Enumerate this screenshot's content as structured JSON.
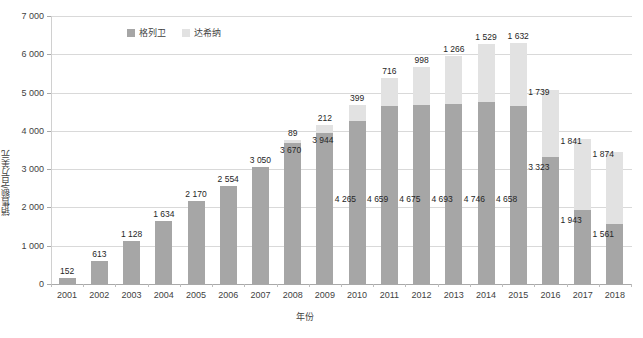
{
  "chart_data": {
    "type": "bar",
    "stacked": true,
    "title": "",
    "xlabel": "年份",
    "ylabel": "销售额/百万美元",
    "ylim": [
      0,
      7000
    ],
    "ytick_labels": [
      "7 000",
      "6 000",
      "5 000",
      "4 000",
      "3 000",
      "2 000",
      "1 000",
      "0"
    ],
    "ytick_values": [
      7000,
      6000,
      5000,
      4000,
      3000,
      2000,
      1000,
      0
    ],
    "grid": true,
    "legend_position": "top-left-inside",
    "categories": [
      "2001",
      "2002",
      "2003",
      "2004",
      "2005",
      "2006",
      "2007",
      "2008",
      "2009",
      "2010",
      "2011",
      "2012",
      "2013",
      "2014",
      "2015",
      "2016",
      "2017",
      "2018"
    ],
    "series": [
      {
        "name": "格列卫",
        "color": "#a6a6a6",
        "values": [
          152,
          613,
          1128,
          1634,
          2170,
          2554,
          3050,
          3670,
          3944,
          4265,
          4659,
          4675,
          4693,
          4746,
          4658,
          3323,
          1943,
          1561
        ],
        "labels": [
          "152",
          "613",
          "1 128",
          "1 634",
          "2 170",
          "2 554",
          "3 050",
          "3 670",
          "3 944",
          "4 265",
          "4 659",
          "4 675",
          "4 693",
          "4 746",
          "4 658",
          "3 323",
          "1 943",
          "1 561"
        ]
      },
      {
        "name": "达希纳",
        "color": "#e2e2e2",
        "values": [
          0,
          0,
          0,
          0,
          0,
          0,
          0,
          89,
          212,
          399,
          716,
          998,
          1266,
          1529,
          1632,
          1739,
          1841,
          1874
        ],
        "labels": [
          "",
          "",
          "",
          "",
          "",
          "",
          "",
          "89",
          "212",
          "399",
          "716",
          "998",
          "1 266",
          "1 529",
          "1 632",
          "1 739",
          "1 841",
          "1 874"
        ]
      }
    ]
  },
  "legend": {
    "items": [
      {
        "label": "格列卫",
        "color": "#a6a6a6"
      },
      {
        "label": "达希纳",
        "color": "#e2e2e2"
      }
    ]
  }
}
